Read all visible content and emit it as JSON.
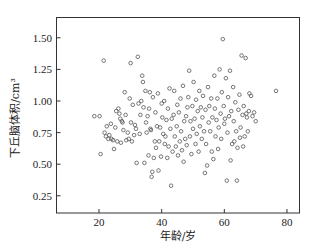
{
  "chart_data": {
    "type": "scatter",
    "title": "",
    "xlabel": "年龄/岁",
    "ylabel": "下丘脑体积/cm³",
    "xlim": [
      7,
      84
    ],
    "ylim": [
      0.12,
      1.66
    ],
    "xticks": [
      20,
      40,
      60,
      80
    ],
    "xtick_labels": [
      "20",
      "40",
      "60",
      "80"
    ],
    "yticks": [
      0.25,
      0.5,
      0.75,
      1.0,
      1.25,
      1.5
    ],
    "ytick_labels": [
      "0.25",
      "0.50",
      "0.75",
      "1.00",
      "1.25",
      "1.50"
    ],
    "grid": false,
    "legend": null,
    "marker": "open-circle",
    "marker_color": "#555555",
    "points": [
      [
        18.5,
        0.88
      ],
      [
        20.2,
        0.88
      ],
      [
        20.5,
        0.58
      ],
      [
        21.5,
        1.32
      ],
      [
        21.8,
        0.75
      ],
      [
        22.2,
        0.72
      ],
      [
        22.5,
        0.8
      ],
      [
        23.0,
        0.7
      ],
      [
        23.3,
        0.73
      ],
      [
        23.8,
        0.82
      ],
      [
        24.0,
        0.7
      ],
      [
        24.5,
        0.69
      ],
      [
        24.8,
        0.62
      ],
      [
        25.2,
        0.79
      ],
      [
        25.5,
        0.92
      ],
      [
        25.8,
        0.68
      ],
      [
        26.2,
        0.94
      ],
      [
        26.5,
        0.9
      ],
      [
        26.8,
        0.86
      ],
      [
        27.0,
        0.67
      ],
      [
        27.3,
        0.84
      ],
      [
        27.5,
        0.83
      ],
      [
        27.8,
        0.77
      ],
      [
        28.2,
        1.07
      ],
      [
        28.5,
        0.89
      ],
      [
        28.7,
        0.69
      ],
      [
        29.2,
        0.75
      ],
      [
        29.5,
        0.7
      ],
      [
        29.8,
        1.02
      ],
      [
        30.1,
        1.3
      ],
      [
        30.2,
        0.83
      ],
      [
        30.5,
        0.68
      ],
      [
        30.8,
        0.97
      ],
      [
        31.2,
        0.73
      ],
      [
        31.5,
        0.81
      ],
      [
        31.8,
        0.78
      ],
      [
        32.0,
        0.51
      ],
      [
        32.4,
        1.35
      ],
      [
        32.6,
        0.98
      ],
      [
        33.0,
        0.74
      ],
      [
        33.2,
        0.89
      ],
      [
        33.5,
        1.0
      ],
      [
        33.8,
        1.2
      ],
      [
        34.0,
        1.15
      ],
      [
        34.2,
        0.95
      ],
      [
        34.5,
        0.51
      ],
      [
        34.8,
        1.08
      ],
      [
        35.0,
        0.83
      ],
      [
        35.2,
        0.75
      ],
      [
        35.5,
        0.88
      ],
      [
        35.8,
        0.57
      ],
      [
        36.0,
        0.94
      ],
      [
        36.2,
        1.07
      ],
      [
        36.4,
        0.78
      ],
      [
        36.6,
        0.77
      ],
      [
        36.8,
        0.4
      ],
      [
        37.0,
        0.44
      ],
      [
        37.2,
        1.03
      ],
      [
        37.5,
        0.55
      ],
      [
        37.8,
        0.68
      ],
      [
        38.0,
        0.91
      ],
      [
        38.2,
        0.63
      ],
      [
        38.5,
        0.8
      ],
      [
        38.8,
        1.06
      ],
      [
        39.0,
        0.45
      ],
      [
        39.2,
        0.68
      ],
      [
        39.5,
        0.79
      ],
      [
        39.8,
        0.56
      ],
      [
        40.0,
        0.98
      ],
      [
        40.2,
        0.87
      ],
      [
        40.5,
        0.74
      ],
      [
        40.8,
        1.0
      ],
      [
        41.0,
        0.66
      ],
      [
        41.2,
        0.72
      ],
      [
        41.5,
        0.85
      ],
      [
        41.8,
        0.55
      ],
      [
        42.0,
        0.94
      ],
      [
        42.2,
        0.64
      ],
      [
        42.5,
        1.1
      ],
      [
        42.8,
        0.78
      ],
      [
        43.0,
        0.33
      ],
      [
        43.2,
        0.86
      ],
      [
        43.5,
        0.6
      ],
      [
        43.8,
        0.89
      ],
      [
        44.0,
        1.08
      ],
      [
        44.2,
        0.72
      ],
      [
        44.5,
        0.64
      ],
      [
        44.8,
        0.8
      ],
      [
        45.0,
        0.97
      ],
      [
        45.2,
        0.57
      ],
      [
        45.5,
        0.91
      ],
      [
        45.8,
        0.68
      ],
      [
        46.0,
        1.02
      ],
      [
        46.2,
        0.76
      ],
      [
        46.5,
        0.61
      ],
      [
        46.8,
        1.12
      ],
      [
        47.0,
        0.52
      ],
      [
        47.2,
        0.84
      ],
      [
        47.5,
        0.7
      ],
      [
        47.8,
        0.88
      ],
      [
        48.0,
        0.65
      ],
      [
        48.2,
        0.95
      ],
      [
        48.5,
        1.03
      ],
      [
        48.8,
        1.24
      ],
      [
        49.0,
        0.72
      ],
      [
        49.2,
        0.84
      ],
      [
        49.5,
        0.58
      ],
      [
        49.8,
        0.96
      ],
      [
        50.0,
        0.78
      ],
      [
        50.2,
        1.15
      ],
      [
        50.5,
        0.86
      ],
      [
        50.8,
        0.66
      ],
      [
        51.0,
        1.01
      ],
      [
        51.2,
        0.74
      ],
      [
        51.5,
        0.92
      ],
      [
        51.8,
        0.6
      ],
      [
        52.0,
        1.08
      ],
      [
        52.2,
        0.8
      ],
      [
        52.5,
        0.95
      ],
      [
        52.8,
        0.7
      ],
      [
        53.0,
        0.87
      ],
      [
        53.2,
        1.04
      ],
      [
        53.5,
        0.76
      ],
      [
        53.8,
        0.43
      ],
      [
        54.0,
        0.93
      ],
      [
        54.2,
        0.66
      ],
      [
        54.5,
        0.49
      ],
      [
        54.8,
        1.11
      ],
      [
        55.0,
        0.83
      ],
      [
        55.2,
        0.96
      ],
      [
        55.5,
        0.76
      ],
      [
        55.8,
        1.02
      ],
      [
        56.0,
        0.6
      ],
      [
        56.2,
        0.87
      ],
      [
        56.5,
        0.54
      ],
      [
        56.8,
        1.2
      ],
      [
        57.0,
        0.94
      ],
      [
        57.2,
        0.72
      ],
      [
        57.5,
        0.85
      ],
      [
        57.8,
        1.02
      ],
      [
        58.0,
        0.62
      ],
      [
        58.2,
        0.79
      ],
      [
        58.5,
        1.25
      ],
      [
        58.8,
        0.9
      ],
      [
        59.0,
        0.7
      ],
      [
        59.2,
        1.07
      ],
      [
        59.5,
        1.49
      ],
      [
        59.8,
        0.96
      ],
      [
        60.0,
        0.82
      ],
      [
        60.2,
        0.86
      ],
      [
        60.5,
        1.18
      ],
      [
        60.8,
        0.37
      ],
      [
        61.0,
        0.75
      ],
      [
        61.2,
        1.03
      ],
      [
        61.5,
        0.88
      ],
      [
        61.8,
        1.24
      ],
      [
        62.0,
        0.53
      ],
      [
        62.2,
        0.92
      ],
      [
        62.5,
        0.66
      ],
      [
        62.8,
        1.11
      ],
      [
        63.0,
        0.84
      ],
      [
        63.2,
        0.68
      ],
      [
        63.5,
        0.99
      ],
      [
        63.8,
        0.76
      ],
      [
        64.0,
        0.37
      ],
      [
        64.2,
        0.63
      ],
      [
        64.5,
        0.93
      ],
      [
        64.8,
        1.05
      ],
      [
        65.0,
        0.71
      ],
      [
        65.2,
        0.79
      ],
      [
        65.5,
        1.36
      ],
      [
        65.8,
        0.89
      ],
      [
        66.0,
        0.64
      ],
      [
        66.2,
        0.96
      ],
      [
        66.5,
        0.72
      ],
      [
        66.8,
        1.34
      ],
      [
        67.0,
        0.9
      ],
      [
        67.2,
        0.87
      ],
      [
        67.5,
        0.76
      ],
      [
        67.8,
        0.92
      ],
      [
        68.0,
        1.06
      ],
      [
        68.5,
        1.04
      ],
      [
        69.0,
        0.88
      ],
      [
        69.5,
        0.91
      ],
      [
        70.0,
        0.84
      ],
      [
        76.5,
        1.08
      ]
    ]
  }
}
